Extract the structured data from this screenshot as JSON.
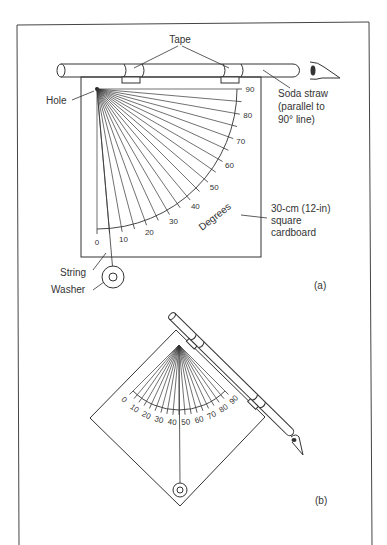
{
  "figure_a": {
    "labels": {
      "tape": "Tape",
      "hole": "Hole",
      "straw_line1": "Soda straw",
      "straw_line2": "(parallel to",
      "straw_line3": "90° line)",
      "card_line1": "30-cm (12-in)",
      "card_line2": "square",
      "card_line3": "cardboard",
      "degrees": "Degrees",
      "string": "String",
      "washer": "Washer",
      "panel": "(a)"
    },
    "scale_ticks": [
      "0",
      "10",
      "20",
      "30",
      "40",
      "50",
      "60",
      "70",
      "80",
      "90"
    ]
  },
  "figure_b": {
    "labels": {
      "panel": "(b)"
    },
    "scale_ticks": [
      "0",
      "10",
      "20",
      "30",
      "40",
      "50",
      "60",
      "70",
      "80",
      "90"
    ]
  },
  "colors": {
    "line": "#333333",
    "background": "#ffffff"
  }
}
